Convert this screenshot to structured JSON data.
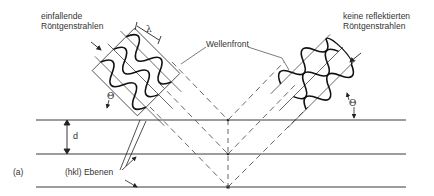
{
  "diagram": {
    "panel_label": "(a)",
    "incident_label_line1": "einfallende",
    "incident_label_line2": "Röntgenstrahlen",
    "reflected_label_line1": "keine reflektierten",
    "reflected_label_line2": "Röntgenstrahlen",
    "wavefront_label": "Wellenfront",
    "planes_label": "(hkl) Ebenen",
    "spacing_symbol": "d",
    "wavelength_symbol": "λ",
    "angle_symbol_left": "Θ",
    "angle_symbol_right": "Θ",
    "colors": {
      "line": "#3a3a3a",
      "wave": "#111111",
      "dashed": "#555555"
    }
  }
}
